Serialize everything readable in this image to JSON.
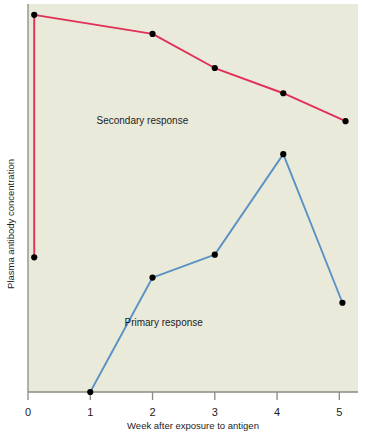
{
  "figure": {
    "background_color": "#ffffff",
    "plot_background_color": "#eaeadb",
    "axis_color": "#8a8a80"
  },
  "chart_data": {
    "type": "line",
    "title": "",
    "subtitle": "",
    "xlabel": "Week after exposure to antigen",
    "ylabel": "Plasma antibody concentration",
    "xlim": [
      0,
      5.3
    ],
    "ylim": [
      0,
      100
    ],
    "grid": false,
    "legend_position": "inline-annotations",
    "x_ticks": [
      0,
      1,
      2,
      3,
      4,
      5
    ],
    "x_tick_labels": [
      "0",
      "1",
      "2",
      "3",
      "4",
      "5"
    ],
    "y_ticks": [],
    "y_tick_labels": [],
    "marker": "filled-circle",
    "marker_color": "#000000",
    "series": [
      {
        "name": "Secondary response",
        "color": "#e0305a",
        "label_x": 1.1,
        "label_y": 69,
        "x": [
          0.1,
          0.1,
          2.0,
          3.0,
          4.1,
          5.1
        ],
        "y": [
          34.7,
          97.2,
          92.3,
          83.5,
          77.0,
          69.8
        ],
        "points_drawn": [
          {
            "week": 0.1,
            "value": 34.7
          },
          {
            "week": 0.1,
            "value": 97.2
          },
          {
            "week": 2.0,
            "value": 92.3
          },
          {
            "week": 3.0,
            "value": 83.5
          },
          {
            "week": 4.1,
            "value": 77.0
          },
          {
            "week": 5.1,
            "value": 69.8
          }
        ]
      },
      {
        "name": "Primary response",
        "color": "#5b92c4",
        "label_x": 1.55,
        "label_y": 17,
        "x": [
          1.0,
          2.0,
          3.0,
          4.1,
          5.05
        ],
        "y": [
          0.0,
          29.5,
          35.4,
          61.3,
          23.0
        ],
        "points_drawn": [
          {
            "week": 1.0,
            "value": 0.0
          },
          {
            "week": 2.0,
            "value": 29.5
          },
          {
            "week": 3.0,
            "value": 35.4
          },
          {
            "week": 4.1,
            "value": 61.3
          },
          {
            "week": 5.05,
            "value": 23.0
          }
        ]
      }
    ]
  }
}
